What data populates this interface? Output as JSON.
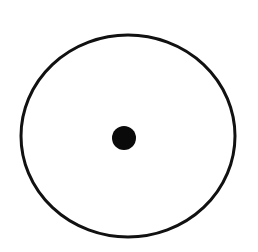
{
  "diagram": {
    "background": "#ffffff",
    "outer_ellipse": {
      "cx": 128,
      "cy": 136,
      "rx": 107,
      "ry": 101,
      "stroke": "#111111",
      "stroke_width": 3,
      "fill": "none"
    },
    "center_dot": {
      "cx": 124,
      "cy": 138,
      "r": 12,
      "fill": "#0a0a0a"
    }
  }
}
